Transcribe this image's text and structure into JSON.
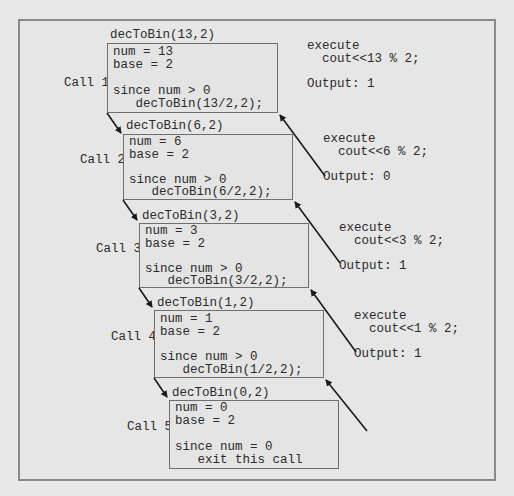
{
  "calls": [
    {
      "label": "Call 1",
      "header": "decToBin(13,2)",
      "lines": [
        "num = 13",
        "base = 2",
        "",
        "since num > 0",
        "   decToBin(13/2,2);"
      ]
    },
    {
      "label": "Call 2",
      "header": "decToBin(6,2)",
      "lines": [
        "num = 6",
        "base = 2",
        "",
        "since num > 0",
        "   decToBin(6/2,2);"
      ]
    },
    {
      "label": "Call 3",
      "header": "decToBin(3,2)",
      "lines": [
        "num = 3",
        "base = 2",
        "",
        "since num > 0",
        "   decToBin(3/2,2);"
      ]
    },
    {
      "label": "Call 4",
      "header": "decToBin(1,2)",
      "lines": [
        "num = 1",
        "base = 2",
        "",
        "since num > 0",
        "   decToBin(1/2,2);"
      ]
    },
    {
      "label": "Call 5",
      "header": "decToBin(0,2)",
      "lines": [
        "num = 0",
        "base = 2",
        "",
        "since num = 0",
        "   exit this call"
      ]
    }
  ],
  "returns": [
    {
      "execute": "execute",
      "statement": "  cout<<13 % 2;",
      "output": "Output: 1"
    },
    {
      "execute": "execute",
      "statement": "  cout<<6 % 2;",
      "output": "Output: 0"
    },
    {
      "execute": "execute",
      "statement": "  cout<<3 % 2;",
      "output": "Output: 1"
    },
    {
      "execute": "execute",
      "statement": "  cout<<1 % 2;",
      "output": "Output: 1"
    }
  ],
  "colors": {
    "background": "#e8e8e8",
    "frame_border": "#8a8a8a",
    "box_border": "#6f6f6f",
    "text": "#2b2b2b",
    "arrow": "#1a1a1a"
  }
}
